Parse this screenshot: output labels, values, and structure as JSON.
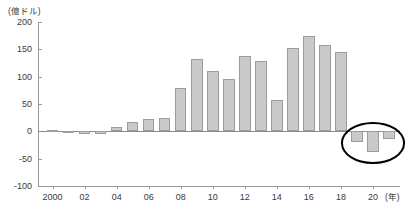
{
  "chart_data": {
    "type": "bar",
    "title": "",
    "subtitle": "",
    "xlabel": "(年)",
    "ylabel": "(億ドル)",
    "ylim": [
      -100,
      200
    ],
    "yticks": [
      200,
      150,
      100,
      50,
      0,
      -50,
      -100
    ],
    "grid": false,
    "legend": null,
    "categories": [
      "2000",
      "2001",
      "2002",
      "2003",
      "2004",
      "2005",
      "2006",
      "2007",
      "2008",
      "2009",
      "2010",
      "2011",
      "2012",
      "2013",
      "2014",
      "2015",
      "2016",
      "2017",
      "2018",
      "2019",
      "2020",
      "2021"
    ],
    "xtick_labels": [
      "2000",
      "02",
      "04",
      "06",
      "08",
      "10",
      "12",
      "14",
      "16",
      "18",
      "20"
    ],
    "values": [
      2,
      1,
      -5,
      -4,
      8,
      17,
      22,
      25,
      80,
      132,
      110,
      96,
      138,
      128,
      57,
      152,
      175,
      158,
      146,
      -20,
      -37,
      -14
    ],
    "annotations": [
      {
        "kind": "ellipse",
        "label": "highlight-negative-years",
        "covers": [
          "2019",
          "2020",
          "2021"
        ],
        "color": "#000000"
      }
    ]
  },
  "axis": {
    "y_unit": "(億ドル)",
    "x_unit": "(年)"
  },
  "colors": {
    "bar_fill": "#c9c9c9",
    "bar_border": "#9d9d9d",
    "axis": "#9a9a9a",
    "text": "#3a3a3a",
    "annotation": "#000000"
  }
}
